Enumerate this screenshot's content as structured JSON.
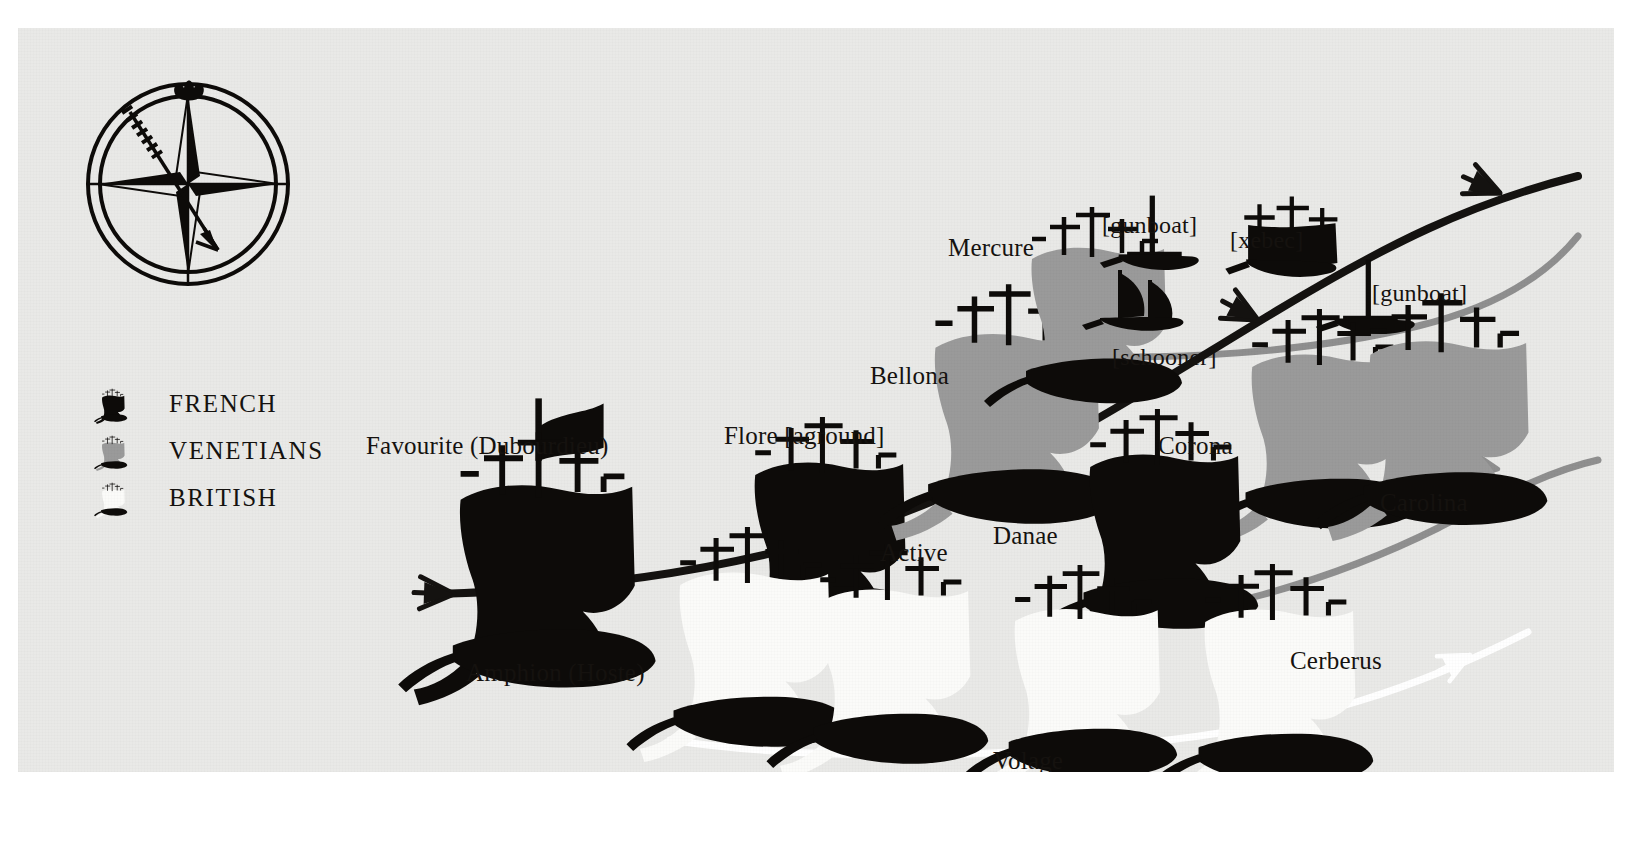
{
  "page": {
    "cropped_header": "",
    "background_color": "#ffffff",
    "panel_color": "#e9e9e7"
  },
  "colors": {
    "french": "#0d0b09",
    "venetian": "#9a9a9a",
    "british": "#fbfbf9",
    "hull": "#0d0b09",
    "french_line": "#141210",
    "venetian_line": "#8f8f8f",
    "british_line": "#ffffff",
    "text": "#15120f"
  },
  "compass": {
    "name": "compass-rose",
    "wind_arrow": "wind-direction-arrow"
  },
  "legend": {
    "items": [
      {
        "label": "FRENCH",
        "fleet": "french",
        "icon": "french-ship-icon"
      },
      {
        "label": "VENETIANS",
        "fleet": "venetian",
        "icon": "venetian-ship-icon"
      },
      {
        "label": "BRITISH",
        "fleet": "british",
        "icon": "british-ship-icon"
      }
    ]
  },
  "fleets": {
    "french": {
      "name": "French",
      "line_label": "french-course-line"
    },
    "venetian": {
      "name": "Venetians",
      "line_label": "venetian-course-line"
    },
    "british": {
      "name": "British",
      "line_label": "british-course-line"
    }
  },
  "ships": [
    {
      "id": "favourite",
      "label": "Favourite (Dubourdieu)",
      "fleet": "french",
      "label_x": 348,
      "label_y": 405,
      "ship_x": 440,
      "ship_y": 438,
      "scale": 1.3,
      "flag": true
    },
    {
      "id": "flore",
      "label": "Flore [aground]",
      "fleet": "french",
      "label_x": 706,
      "label_y": 395,
      "ship_x": 735,
      "ship_y": 418,
      "scale": 1.12,
      "flag": false
    },
    {
      "id": "bellona",
      "label": "Bellona",
      "fleet": "venetian",
      "label_x": 852,
      "label_y": 335,
      "ship_x": 915,
      "ship_y": 288,
      "scale": 1.22,
      "flag": false
    },
    {
      "id": "mercure",
      "label": "Mercure",
      "fleet": "venetian",
      "label_x": 930,
      "label_y": 207,
      "ship_x": 1012,
      "ship_y": 205,
      "scale": 1.0,
      "flag": false
    },
    {
      "id": "gunboat-1",
      "label": "[gunboat]",
      "fleet": "french",
      "label_x": 1084,
      "label_y": 185,
      "ship_x": 1128,
      "ship_y": 218,
      "type": "gunboat"
    },
    {
      "id": "schooner",
      "label": "[schooner]",
      "fleet": "french",
      "label_x": 1094,
      "label_y": 317,
      "ship_x": 1098,
      "ship_y": 282,
      "type": "schooner"
    },
    {
      "id": "xebec",
      "label": "[xebec]",
      "fleet": "french",
      "label_x": 1212,
      "label_y": 200,
      "ship_x": 1232,
      "ship_y": 218,
      "type": "xebec"
    },
    {
      "id": "gunboat-2",
      "label": "[gunboat]",
      "fleet": "french",
      "label_x": 1354,
      "label_y": 253,
      "ship_x": 1344,
      "ship_y": 282,
      "type": "gunboat"
    },
    {
      "id": "corona",
      "label": "Corona",
      "fleet": "venetian",
      "label_x": 1140,
      "label_y": 405,
      "ship_x": 1232,
      "ship_y": 310,
      "scale": 1.12,
      "flag": false
    },
    {
      "id": "carolina",
      "label": "Carolina",
      "fleet": "venetian",
      "label_x": 1362,
      "label_y": 462,
      "ship_x": 1350,
      "ship_y": 296,
      "scale": 1.18,
      "flag": false
    },
    {
      "id": "danae",
      "label": "Danae",
      "fleet": "french",
      "label_x": 975,
      "label_y": 495,
      "ship_x": 1070,
      "ship_y": 410,
      "scale": 1.12,
      "flag": false
    },
    {
      "id": "amphion",
      "label": "Amphion (Hoste)",
      "fleet": "british",
      "label_x": 448,
      "label_y": 632,
      "ship_x": 660,
      "ship_y": 528,
      "scale": 1.12
    },
    {
      "id": "active",
      "label": "Active",
      "fleet": "british",
      "label_x": 862,
      "label_y": 512,
      "ship_x": 800,
      "ship_y": 545,
      "scale": 1.12
    },
    {
      "id": "volage",
      "label": "Volage",
      "fleet": "british",
      "label_x": 975,
      "label_y": 720,
      "ship_x": 995,
      "ship_y": 565,
      "scale": 1.08
    },
    {
      "id": "cerberus",
      "label": "Cerberus",
      "fleet": "british",
      "label_x": 1272,
      "label_y": 620,
      "ship_x": 1185,
      "ship_y": 565,
      "scale": 1.12
    }
  ],
  "course_lines": [
    {
      "id": "french-line",
      "fleet": "french",
      "arrowheads": 3
    },
    {
      "id": "venetian-line",
      "fleet": "venetian",
      "arrowheads": 2
    },
    {
      "id": "british-line",
      "fleet": "british",
      "arrowheads": 1
    }
  ]
}
